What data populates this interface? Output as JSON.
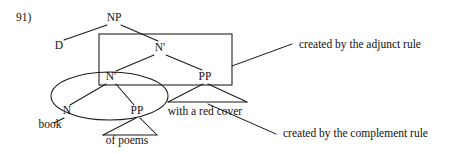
{
  "figure": {
    "item_number": "91)",
    "type": "syntax-tree",
    "tree": {
      "nodes": [
        {
          "id": "NP",
          "label": "NP",
          "x": 114,
          "y": 21
        },
        {
          "id": "D",
          "label": "D",
          "x": 59,
          "y": 49
        },
        {
          "id": "N1hi",
          "label": "N'",
          "x": 160,
          "y": 51
        },
        {
          "id": "N1lo",
          "label": "N'",
          "x": 111,
          "y": 80
        },
        {
          "id": "PPhi",
          "label": "PP",
          "x": 205,
          "y": 80
        },
        {
          "id": "N",
          "label": "N",
          "x": 67,
          "y": 114
        },
        {
          "id": "PPlo",
          "label": "PP",
          "x": 137,
          "y": 114
        }
      ],
      "terminals": [
        {
          "id": "book",
          "label": "book",
          "x": 50,
          "y": 128
        },
        {
          "id": "ofpoems",
          "label": "of poems",
          "x": 127,
          "y": 144
        },
        {
          "id": "withcover",
          "label": "with a red cover",
          "x": 205,
          "y": 115
        }
      ]
    },
    "annotations": [
      {
        "id": "adjunct",
        "label": "created by the adjunct rule",
        "x": 299,
        "y": 48
      },
      {
        "id": "complement",
        "label": "created by the complement rule",
        "x": 283,
        "y": 137
      }
    ],
    "highlights": [
      {
        "id": "adjunct-box",
        "shape": "rectangle",
        "note": "box around upper N' spanning N' and PP"
      },
      {
        "id": "complement-ellipse",
        "shape": "ellipse",
        "note": "ellipse around lower N' spanning N and PP"
      }
    ],
    "colors": {
      "ink": "#1a1a1a",
      "background": "#ffffff"
    }
  }
}
